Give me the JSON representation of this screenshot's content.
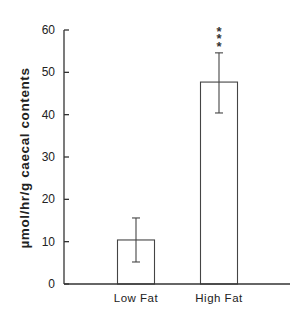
{
  "chart_data": {
    "type": "bar",
    "title": "",
    "xlabel": "",
    "ylabel": "µmol/hr/g caecal contents",
    "categories": [
      "Low Fat",
      "High Fat"
    ],
    "values": [
      10.4,
      47.7
    ],
    "error_bars": [
      {
        "low": 5.2,
        "high": 15.6
      },
      {
        "low": 40.4,
        "high": 54.6
      }
    ],
    "annotations": [
      {
        "category": "High Fat",
        "text": "***",
        "orientation": "vertical"
      }
    ],
    "ylim": [
      0,
      60
    ],
    "yticks": [
      0,
      10,
      20,
      30,
      40,
      50,
      60
    ],
    "grid": false,
    "legend": "none",
    "bar_fill": "#ffffff",
    "bar_stroke": "#444444"
  }
}
